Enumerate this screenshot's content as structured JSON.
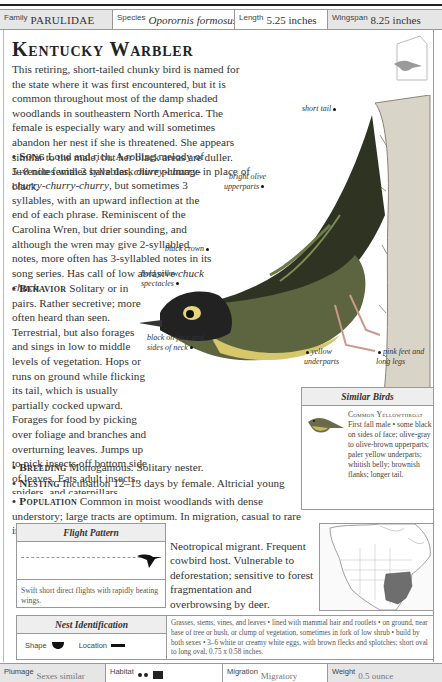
{
  "header": {
    "family": {
      "label": "Family",
      "value": "PARULIDAE"
    },
    "species": {
      "label": "Species",
      "value": "Oporornis formosus"
    },
    "length": {
      "label": "Length",
      "value": "5.25 inches"
    },
    "wingspan": {
      "label": "Wingspan",
      "value": "8.25 inches"
    }
  },
  "title": "Kentucky Warbler",
  "intro": "This retiring, short-tailed chunky bird is named for the state where it was first encountered, but it is common throughout most of the damp shaded woodlands in southeastern North America. The female is especially wary and will sometimes abandon her nest if she is threatened. She appears similar to the male, but her black areas are duller. Juvenile females have dark olive plumage in place of black.",
  "sections": {
    "song": {
      "heading": "Song",
      "text_a": "Loud and rich. A rolling melody of 5–8 notes with 2 syllables, ",
      "call_a": "churry-churry-churry-churry-churry",
      "text_b": ", but sometimes 3 syllables, with an upward inflection at the end of each phrase. Reminiscent of the Carolina Wren, but drier sounding, and although the wren may give 2-syllabled notes, more often has 3-syllabled notes in its song series. Has call of low abrasive ",
      "call_b": "chuck chuck",
      "text_c": "."
    },
    "behavior": {
      "heading": "Behavior",
      "text": "Solitary or in pairs. Rather secretive; more often heard than seen. Terrestrial, but also forages and sings in low to middle levels of vegetation. Hops or runs on ground while flicking its tail, which is usually partially cocked upward. Forages for food by picking over foliage and branches and overturning leaves. Jumps up to pick insects off bottom side of leaves. Eats adult insects, spiders, and caterpillars."
    },
    "breeding": {
      "heading": "Breeding",
      "text": "Monogamous. Solitary nester."
    },
    "nesting": {
      "heading": "Nesting",
      "text": "Incubation 12–13 days by female. Altricial young brooded by female; stay in nest 8–10 days, fed by both sexes, but female does more. 1 brood per year."
    },
    "population": {
      "heading": "Population",
      "text": "Common in moist woodlands with dense understory; large tracts are optimum. In migration, casual to rare in the Southwest to California."
    },
    "conservation": {
      "heading": "Conservation",
      "text": "Neotropical migrant. Frequent cowbird host. Vulnerable to deforestation; sensitive to forest fragmentation and overbrowsing by deer."
    }
  },
  "callouts": {
    "short_tail": "short tail",
    "bright_olive": "bright olive upperparts",
    "black_crown": "black crown",
    "bold_yellow": "bold yellow spectacles",
    "black_face": "black on face and sides of neck",
    "yellow_under": "yellow underparts",
    "pink_feet": "pink feet and long legs"
  },
  "similar_birds": {
    "header": "Similar Birds",
    "name": "Common Yellowthroat",
    "desc": "First fall male • some black on sides of face; olive-gray to olive-brown upperparts; paler yellow underparts; whitish belly; brownish flanks; longer tail."
  },
  "flight_pattern": {
    "header": "Flight Pattern",
    "caption": "Swift short direct flights with rapidly beating wings."
  },
  "nest_identification": {
    "header": "Nest Identification",
    "shape_label": "Shape",
    "location_label": "Location",
    "text": "Grasses, stems, vines, and leaves • lined with mammal hair and rootlets • on ground, near base of tree or bush, or clump of vegetation, sometimes in fork of low shrub • build by both sexes • 3–6 white or creamy white eggs, with brown flecks and splotches; short oval to long oval, 0.75 x 0.58 inches."
  },
  "footer": {
    "plumage": {
      "label": "Plumage",
      "value": "Sexes similar"
    },
    "habitat": {
      "label": "Habitat",
      "value": ""
    },
    "migration": {
      "label": "Migration",
      "value": "Migratory"
    },
    "weight": {
      "label": "Weight",
      "value": "0.5 ounce"
    }
  }
}
